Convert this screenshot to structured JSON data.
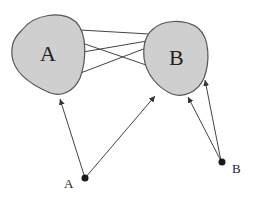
{
  "diagram": {
    "regions": [
      {
        "id": "A",
        "label": "A"
      },
      {
        "id": "B",
        "label": "B"
      }
    ],
    "points": [
      {
        "id": "A",
        "label": "A"
      },
      {
        "id": "B",
        "label": "B"
      }
    ],
    "links_between_regions": 4,
    "arrows": [
      {
        "from": "point A",
        "to": "region A"
      },
      {
        "from": "point A",
        "to": "region B"
      },
      {
        "from": "point B",
        "to": "region B"
      },
      {
        "from": "point B",
        "to": "region B"
      }
    ],
    "colors": {
      "region_fill": "#cfcfcf",
      "region_stroke": "#555555",
      "line": "#444444",
      "point": "#1a1a1a"
    }
  }
}
